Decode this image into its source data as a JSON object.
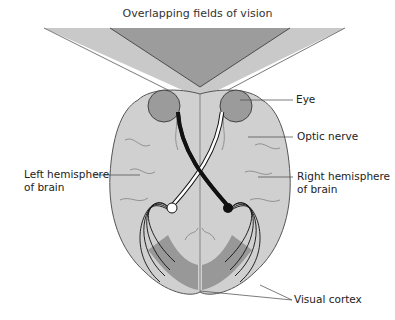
{
  "title": "Overlapping fields of vision",
  "labels": {
    "eye": "Eye",
    "optic_nerve": "Optic nerve",
    "left_hemisphere_line1": "Left hemisphere",
    "left_hemisphere_line2": "of brain",
    "right_hemisphere_line1": "Right hemisphere",
    "right_hemisphere_line2": "of brain",
    "visual_cortex": "Visual cortex"
  },
  "colors": {
    "field_light": "#c8c8c8",
    "field_overlap": "#9a9a9a",
    "brain": "#cfcfcf",
    "eye": "#9b9b9b",
    "cortex": "#8e8e8e",
    "left_pathway": "#ffffff",
    "right_pathway": "#111111"
  }
}
